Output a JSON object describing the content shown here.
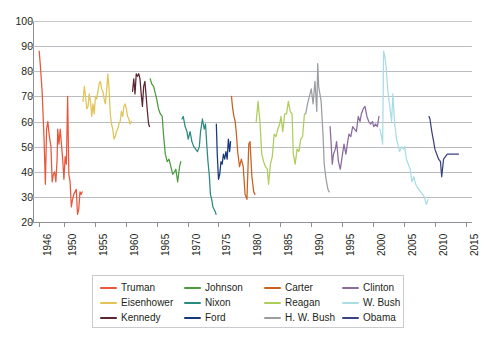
{
  "chart_data": {
    "type": "line",
    "title": "",
    "subtitle": "",
    "xlabel": "",
    "ylabel": "",
    "xlim": [
      1945.0,
      2016.0
    ],
    "ylim": [
      20,
      100
    ],
    "grid": true,
    "legend_position": "bottom",
    "y_ticks": [
      100,
      90,
      80,
      70,
      60,
      50,
      40,
      30,
      20
    ],
    "x_ticks": [
      1946,
      1950,
      1955,
      1960,
      1965,
      1970,
      1975,
      1980,
      1985,
      1990,
      1995,
      2000,
      2005,
      2010,
      2015
    ],
    "x_tick_labels": [
      "1946",
      "1950",
      "1955",
      "1960",
      "1965",
      "1970",
      "1975",
      "1980",
      "1985",
      "1990",
      "1995",
      "2000",
      "2005",
      "2010",
      "2015"
    ],
    "y_tick_labels": [
      "100",
      "90",
      "80",
      "70",
      "60",
      "50",
      "40",
      "30",
      "20"
    ],
    "series": [
      {
        "name": "Truman",
        "color": "#e8563c",
        "x": [
          1946.0,
          1946.2,
          1946.5,
          1946.8,
          1947.0,
          1947.2,
          1947.4,
          1947.6,
          1947.9,
          1948.1,
          1948.3,
          1948.5,
          1948.7,
          1948.9,
          1949.0,
          1949.2,
          1949.4,
          1949.6,
          1949.8,
          1950.0,
          1950.2,
          1950.4,
          1950.6,
          1950.8,
          1951.0,
          1951.2,
          1951.4,
          1951.6,
          1951.8,
          1952.0,
          1952.2,
          1952.4,
          1952.6,
          1952.8,
          1952.95
        ],
        "values": [
          88,
          82,
          71,
          52,
          35,
          57,
          60,
          55,
          50,
          36,
          39,
          40,
          36,
          45,
          57,
          51,
          57,
          51,
          45,
          37,
          46,
          43,
          70,
          39,
          36,
          26,
          29,
          31,
          32,
          33,
          23,
          25,
          32,
          31,
          32
        ]
      },
      {
        "name": "Eisenhower",
        "color": "#e0c košul",
        "x": [],
        "values": []
      },
      {
        "name": "Kennedy",
        "color": "#5c2633",
        "x": [
          1961.1,
          1961.3,
          1961.5,
          1961.7,
          1961.9,
          1962.1,
          1962.3,
          1962.5,
          1962.7,
          1962.9,
          1963.1,
          1963.3,
          1963.5,
          1963.7,
          1963.85
        ],
        "values": [
          72,
          77,
          71,
          79,
          78,
          79,
          77,
          71,
          66,
          74,
          76,
          70,
          64,
          59,
          58
        ]
      },
      {
        "name": "Johnson",
        "color": "#4c9b3f",
        "x": [
          1963.95,
          1964.2,
          1964.5,
          1964.8,
          1965.0,
          1965.3,
          1965.6,
          1965.9,
          1966.1,
          1966.4,
          1966.7,
          1967.0,
          1967.3,
          1967.6,
          1967.9,
          1968.1,
          1968.4,
          1968.7,
          1968.9
        ],
        "values": [
          77,
          75,
          74,
          71,
          69,
          65,
          63,
          62,
          55,
          47,
          44,
          45,
          42,
          39,
          40,
          41,
          36,
          42,
          44
        ]
      },
      {
        "name": "Nixon",
        "color": "#2b8a7e",
        "x": [
          1969.1,
          1969.3,
          1969.6,
          1969.9,
          1970.1,
          1970.4,
          1970.7,
          1971.0,
          1971.3,
          1971.6,
          1971.9,
          1972.1,
          1972.4,
          1972.7,
          1972.9,
          1973.1,
          1973.3,
          1973.5,
          1973.7,
          1973.9,
          1974.1,
          1974.3,
          1974.5,
          1974.6
        ],
        "values": [
          61,
          62,
          58,
          56,
          53,
          56,
          52,
          50,
          49,
          48,
          50,
          56,
          61,
          57,
          59,
          51,
          44,
          39,
          31,
          29,
          26,
          25,
          24,
          23
        ]
      },
      {
        "name": "Ford",
        "color": "#17387a",
        "x": [
          1974.65,
          1974.8,
          1975.0,
          1975.2,
          1975.4,
          1975.6,
          1975.8,
          1976.0,
          1976.2,
          1976.4,
          1976.6,
          1976.8,
          1976.95
        ],
        "values": [
          59,
          47,
          37,
          39,
          44,
          43,
          47,
          45,
          48,
          45,
          53,
          48,
          52
        ]
      },
      {
        "name": "Carter",
        "color": "#c8601f",
        "x": [
          1977.1,
          1977.3,
          1977.5,
          1977.7,
          1977.9,
          1978.1,
          1978.4,
          1978.7,
          1979.0,
          1979.3,
          1979.6,
          1979.9,
          1980.1,
          1980.4,
          1980.7,
          1980.9
        ],
        "values": [
          70,
          65,
          62,
          60,
          55,
          48,
          42,
          45,
          42,
          31,
          29,
          51,
          52,
          38,
          32,
          31
        ]
      },
      {
        "name": "Reagan",
        "color": "#aecd5a",
        "x": [
          1981.1,
          1981.4,
          1981.7,
          1982.0,
          1982.3,
          1982.6,
          1982.9,
          1983.1,
          1983.4,
          1983.7,
          1984.0,
          1984.3,
          1984.6,
          1984.9,
          1985.1,
          1985.4,
          1985.7,
          1986.0,
          1986.3,
          1986.6,
          1986.9,
          1987.1,
          1987.4,
          1987.7,
          1988.0,
          1988.3,
          1988.6,
          1988.9
        ],
        "values": [
          60,
          68,
          60,
          47,
          44,
          42,
          41,
          35,
          43,
          46,
          55,
          54,
          57,
          59,
          62,
          56,
          63,
          63,
          68,
          64,
          63,
          47,
          43,
          49,
          48,
          53,
          54,
          63
        ]
      },
      {
        "name": "H. W. Bush",
        "color": "#9a9ea3",
        "x": [
          1989.1,
          1989.4,
          1989.7,
          1990.0,
          1990.3,
          1990.6,
          1990.9,
          1991.05,
          1991.2,
          1991.4,
          1991.6,
          1991.9,
          1992.1,
          1992.4,
          1992.7,
          1992.9
        ],
        "values": [
          63,
          67,
          70,
          73,
          67,
          76,
          64,
          83,
          74,
          71,
          68,
          55,
          43,
          37,
          33,
          32
        ]
      },
      {
        "name": "Clinton",
        "color": "#8a6b9c",
        "x": [
          1993.05,
          1993.2,
          1993.4,
          1993.6,
          1993.9,
          1994.1,
          1994.4,
          1994.7,
          1995.0,
          1995.3,
          1995.6,
          1995.9,
          1996.1,
          1996.4,
          1996.7,
          1997.0,
          1997.3,
          1997.6,
          1997.9,
          1998.1,
          1998.4,
          1998.7,
          1999.0,
          1999.3,
          1999.6,
          1999.9,
          2000.1,
          2000.4,
          2000.7,
          2000.95
        ],
        "values": [
          58,
          52,
          43,
          47,
          49,
          52,
          44,
          41,
          46,
          51,
          47,
          52,
          55,
          54,
          58,
          57,
          56,
          62,
          60,
          63,
          65,
          66,
          62,
          60,
          59,
          60,
          58,
          59,
          58,
          62
        ]
      },
      {
        "name": "W. Bush",
        "color": "#a9dde3",
        "x": [
          2001.1,
          2001.3,
          2001.55,
          2001.7,
          2001.9,
          2002.1,
          2002.4,
          2002.7,
          2003.0,
          2003.2,
          2003.5,
          2003.8,
          2004.0,
          2004.3,
          2004.6,
          2004.9,
          2005.1,
          2005.4,
          2005.7,
          2006.0,
          2006.3,
          2006.6,
          2006.9,
          2007.1,
          2007.4,
          2007.7,
          2008.0,
          2008.3,
          2008.6,
          2008.9
        ],
        "values": [
          57,
          55,
          51,
          88,
          86,
          82,
          72,
          66,
          60,
          71,
          59,
          53,
          51,
          48,
          50,
          49,
          50,
          45,
          43,
          41,
          36,
          38,
          35,
          34,
          33,
          32,
          31,
          30,
          27,
          29
        ]
      },
      {
        "name": "Obama",
        "color": "#3a4380",
        "x": [
          2009.05,
          2009.2,
          2009.5,
          2009.8,
          2010.0,
          2010.3,
          2010.6,
          2010.9,
          2011.1,
          2011.4,
          2011.7,
          2012.0,
          2012.3,
          2012.6,
          2012.9,
          2013.2,
          2013.5,
          2013.8
        ],
        "values": [
          62,
          61,
          56,
          52,
          49,
          47,
          45,
          44,
          38,
          45,
          46,
          47,
          47,
          47,
          47,
          47,
          47,
          47
        ]
      }
    ]
  },
  "legend": {
    "items": [
      {
        "label": "Truman",
        "color": "#e8563c"
      },
      {
        "label": "Eisenhower",
        "color": "#e2c355"
      },
      {
        "label": "Kennedy",
        "color": "#5c2633"
      },
      {
        "label": "Johnson",
        "color": "#4c9b3f"
      },
      {
        "label": "Nixon",
        "color": "#2b8a7e"
      },
      {
        "label": "Ford",
        "color": "#17387a"
      },
      {
        "label": "Carter",
        "color": "#c8601f"
      },
      {
        "label": "Reagan",
        "color": "#aecd5a"
      },
      {
        "label": "H. W. Bush",
        "color": "#9a9ea3"
      },
      {
        "label": "Clinton",
        "color": "#8a6b9c"
      },
      {
        "label": "W. Bush",
        "color": "#a9dde3"
      },
      {
        "label": "Obama",
        "color": "#3a4380"
      }
    ]
  }
}
